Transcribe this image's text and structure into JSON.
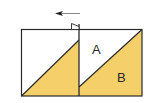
{
  "diagram": {
    "type": "paper-folding",
    "colors": {
      "fill": "#F5CF6A",
      "stroke": "#2a2a2a",
      "background": "#ffffff"
    },
    "labels": {
      "a": "A",
      "b": "B"
    },
    "arrow": {
      "direction": "left"
    },
    "panels": [
      {
        "name": "left-square",
        "shaded": "lower-right triangle"
      },
      {
        "name": "right-square",
        "shaded": "lower-right triangle",
        "regions": [
          "A",
          "B"
        ]
      }
    ]
  }
}
